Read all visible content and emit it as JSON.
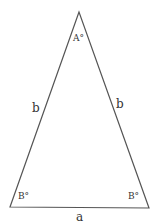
{
  "diagram": {
    "stroke_color": "#555555",
    "vertices": {
      "apex": {
        "x": 79,
        "y": 12
      },
      "bottom_left": {
        "x": 10,
        "y": 207
      },
      "bottom_right": {
        "x": 149,
        "y": 208
      }
    },
    "labels": {
      "apex_angle": "A°",
      "left_angle": "B°",
      "right_angle": "B°",
      "left_side": "b",
      "right_side": "b",
      "base": "a"
    }
  }
}
